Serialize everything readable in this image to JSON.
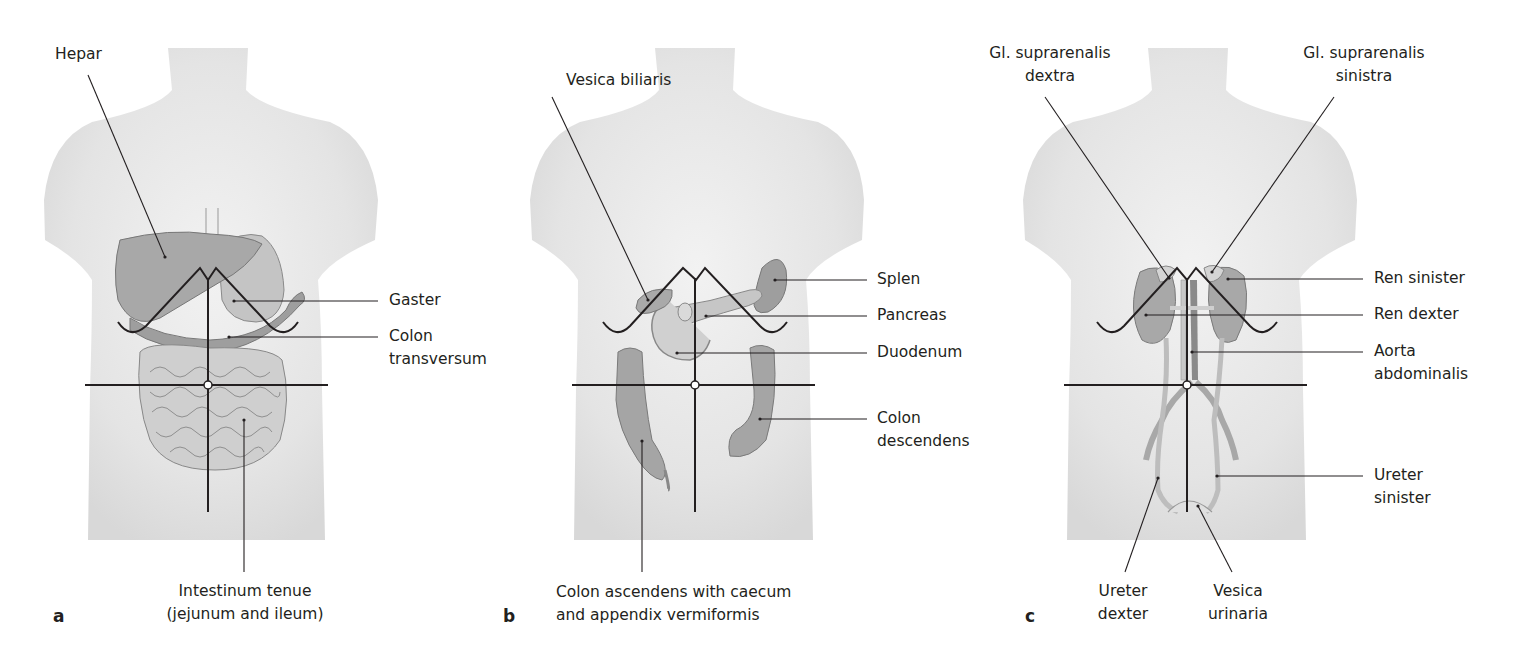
{
  "figure": {
    "panels": [
      {
        "letter": "a",
        "labels": {
          "hepar": "Hepar",
          "gaster": "Gaster",
          "colon_transversum_1": "Colon",
          "colon_transversum_2": "transversum",
          "intestinum_1": "Intestinum tenue",
          "intestinum_2": "(jejunum and ileum)"
        }
      },
      {
        "letter": "b",
        "labels": {
          "vesica_biliaris": "Vesica biliaris",
          "splen": "Splen",
          "pancreas": "Pancreas",
          "duodenum": "Duodenum",
          "colon_descendens_1": "Colon",
          "colon_descendens_2": "descendens",
          "colon_ascendens_1": "Colon ascendens with caecum",
          "colon_ascendens_2": "and appendix vermiformis"
        }
      },
      {
        "letter": "c",
        "labels": {
          "supra_dextra_1": "Gl. suprarenalis",
          "supra_dextra_2": "dextra",
          "supra_sinistra_1": "Gl. suprarenalis",
          "supra_sinistra_2": "sinistra",
          "ren_sinister": "Ren sinister",
          "ren_dexter": "Ren dexter",
          "aorta_1": "Aorta",
          "aorta_2": "abdominalis",
          "ureter_sinister_1": "Ureter",
          "ureter_sinister_2": "sinister",
          "ureter_dexter_1": "Ureter",
          "ureter_dexter_2": "dexter",
          "vesica_urinaria_1": "Vesica",
          "vesica_urinaria_2": "urinaria"
        }
      }
    ],
    "colors": {
      "skin": "#e6e6e6",
      "organ": "#b3b3b3",
      "organ_dark": "#9a9a9a",
      "line": "#231f20"
    }
  }
}
